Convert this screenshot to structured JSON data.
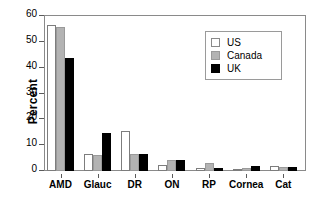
{
  "chart_data": {
    "type": "bar",
    "title": "",
    "xlabel": "",
    "ylabel": "Percent",
    "ylim": [
      0,
      60
    ],
    "yticks": [
      0,
      10,
      20,
      30,
      40,
      50,
      60
    ],
    "grid": false,
    "legend_position": "upper right",
    "categories": [
      "AMD",
      "Glauc",
      "DR",
      "ON",
      "RP",
      "Cornea",
      "Cat"
    ],
    "series": [
      {
        "name": "US",
        "color": "#ffffff",
        "values": [
          56.5,
          6.4,
          15.3,
          2.3,
          1.1,
          0.3,
          1.8
        ]
      },
      {
        "name": "Canada",
        "color": "#b3b3b3",
        "values": [
          55.6,
          6.2,
          6.6,
          4.4,
          3.1,
          1.1,
          1.7
        ]
      },
      {
        "name": "UK",
        "color": "#000000",
        "values": [
          43.6,
          14.6,
          6.4,
          4.1,
          1.1,
          1.9,
          1.7
        ]
      }
    ]
  },
  "legend": {
    "entries": [
      {
        "label": "US"
      },
      {
        "label": "Canada"
      },
      {
        "label": "UK"
      }
    ]
  },
  "axis": {
    "y_title": "Percent",
    "y_tick_labels": [
      "0",
      "10",
      "20",
      "30",
      "40",
      "50",
      "60"
    ],
    "x_tick_labels": [
      "AMD",
      "Glauc",
      "DR",
      "ON",
      "RP",
      "Cornea",
      "Cat"
    ]
  }
}
